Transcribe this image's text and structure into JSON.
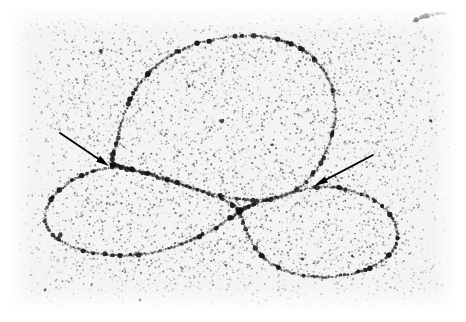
{
  "figure": {
    "kind": "electron-micrograph",
    "subject": "DNA molecule",
    "title": "Electron micrograph of a looped DNA molecule",
    "width_px": 466,
    "height_px": 322,
    "background_color": "#ffffff",
    "plate_color": "#f5f4f2",
    "grain_color": "#2b2b2b",
    "strand_color": "#1a1a1a",
    "arrow_color": "#000000",
    "plate": {
      "left_px": 10,
      "top_px": 7,
      "right_px": 456,
      "bottom_px": 312
    },
    "grain": {
      "density": 9000,
      "min_radius_px": 0.28,
      "max_radius_px": 1.15,
      "seed": 20240517,
      "vignette": true
    }
  },
  "annotations": {
    "arrows": [
      {
        "name": "arrow-left",
        "label": "left arrow",
        "points_to": "left strand-crossing junction",
        "tail_x": 60,
        "tail_y": 133,
        "tip_x": 109,
        "tip_y": 166,
        "head_length_px": 13,
        "head_width_px": 7,
        "shaft_width_px": 1.9
      },
      {
        "name": "arrow-right",
        "label": "right arrow",
        "points_to": "right strand-crossing junction",
        "tail_x": 373,
        "tail_y": 155,
        "tip_x": 314,
        "tip_y": 186,
        "head_length_px": 14,
        "head_width_px": 7,
        "shaft_width_px": 1.9
      }
    ]
  },
  "structures": [
    {
      "name": "dna-upper-loop",
      "label": "upper large DNA loop",
      "closed": true,
      "bead_spacing_px": 2.0,
      "bead_radius_px": 1.25,
      "path": [
        [
          112,
          163
        ],
        [
          116,
          146
        ],
        [
          120,
          128
        ],
        [
          126,
          110
        ],
        [
          134,
          92
        ],
        [
          146,
          76
        ],
        [
          161,
          62
        ],
        [
          179,
          51
        ],
        [
          200,
          43
        ],
        [
          223,
          38
        ],
        [
          247,
          36
        ],
        [
          270,
          38
        ],
        [
          291,
          44
        ],
        [
          309,
          54
        ],
        [
          322,
          68
        ],
        [
          331,
          85
        ],
        [
          335,
          104
        ],
        [
          335,
          123
        ],
        [
          330,
          142
        ],
        [
          322,
          160
        ],
        [
          312,
          175
        ],
        [
          300,
          187
        ],
        [
          286,
          195
        ],
        [
          272,
          199
        ],
        [
          256,
          200
        ],
        [
          240,
          199
        ],
        [
          222,
          196
        ],
        [
          203,
          191
        ],
        [
          184,
          185
        ],
        [
          166,
          179
        ],
        [
          150,
          174
        ],
        [
          134,
          170
        ],
        [
          122,
          166
        ],
        [
          112,
          163
        ]
      ]
    },
    {
      "name": "dna-lower-left-loop",
      "label": "lower left DNA loop",
      "closed": true,
      "bead_spacing_px": 2.0,
      "bead_radius_px": 1.25,
      "path": [
        [
          112,
          167
        ],
        [
          99,
          170
        ],
        [
          86,
          174
        ],
        [
          73,
          180
        ],
        [
          62,
          188
        ],
        [
          53,
          197
        ],
        [
          47,
          207
        ],
        [
          45,
          217
        ],
        [
          47,
          227
        ],
        [
          54,
          236
        ],
        [
          64,
          243
        ],
        [
          78,
          249
        ],
        [
          95,
          253
        ],
        [
          114,
          255
        ],
        [
          134,
          255
        ],
        [
          155,
          252
        ],
        [
          176,
          246
        ],
        [
          196,
          238
        ],
        [
          214,
          229
        ],
        [
          229,
          219
        ],
        [
          239,
          211
        ],
        [
          230,
          203
        ],
        [
          216,
          197
        ],
        [
          200,
          191
        ],
        [
          183,
          185
        ],
        [
          166,
          180
        ],
        [
          150,
          175
        ],
        [
          136,
          171
        ],
        [
          123,
          168
        ],
        [
          112,
          167
        ]
      ]
    },
    {
      "name": "dna-lower-right-loop",
      "label": "lower right DNA loop",
      "closed": true,
      "bead_spacing_px": 2.0,
      "bead_radius_px": 1.25,
      "path": [
        [
          241,
          210
        ],
        [
          258,
          203
        ],
        [
          276,
          197
        ],
        [
          294,
          192
        ],
        [
          312,
          188
        ],
        [
          330,
          187
        ],
        [
          348,
          190
        ],
        [
          366,
          196
        ],
        [
          381,
          205
        ],
        [
          392,
          217
        ],
        [
          397,
          230
        ],
        [
          396,
          243
        ],
        [
          389,
          255
        ],
        [
          377,
          264
        ],
        [
          362,
          271
        ],
        [
          345,
          275
        ],
        [
          327,
          277
        ],
        [
          309,
          276
        ],
        [
          292,
          273
        ],
        [
          277,
          267
        ],
        [
          265,
          259
        ],
        [
          256,
          249
        ],
        [
          250,
          238
        ],
        [
          245,
          227
        ],
        [
          242,
          218
        ],
        [
          241,
          210
        ]
      ]
    },
    {
      "name": "dna-fragment-upper-right",
      "label": "small linear DNA fragment",
      "closed": false,
      "bead_spacing_px": 2.0,
      "bead_radius_px": 1.25,
      "path": [
        [
          414,
          21
        ],
        [
          420,
          18
        ],
        [
          427,
          16
        ],
        [
          434,
          14
        ],
        [
          441,
          13
        ],
        [
          447,
          13
        ]
      ]
    }
  ],
  "junctions": [
    {
      "name": "junction-left",
      "label": "left crossing",
      "x": 112,
      "y": 165
    },
    {
      "name": "junction-right",
      "label": "right crossing",
      "x": 240,
      "y": 211
    }
  ],
  "debris": [
    {
      "x": 222,
      "y": 121,
      "r": 2.6
    },
    {
      "x": 101,
      "y": 51,
      "r": 2.2
    },
    {
      "x": 60,
      "y": 235,
      "r": 2.4
    },
    {
      "x": 358,
      "y": 271,
      "r": 1.9
    },
    {
      "x": 352,
      "y": 256,
      "r": 1.6
    },
    {
      "x": 302,
      "y": 259,
      "r": 1.8
    },
    {
      "x": 189,
      "y": 86,
      "r": 1.7
    },
    {
      "x": 431,
      "y": 121,
      "r": 2.0
    },
    {
      "x": 272,
      "y": 145,
      "r": 1.5
    },
    {
      "x": 140,
      "y": 300,
      "r": 1.6
    },
    {
      "x": 399,
      "y": 61,
      "r": 1.5
    },
    {
      "x": 45,
      "y": 290,
      "r": 1.7
    }
  ]
}
